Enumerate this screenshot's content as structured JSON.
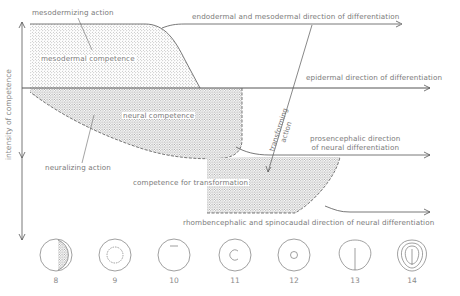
{
  "diagram": {
    "y_axis_label": "intensity of competence",
    "regions": {
      "mesodermal": "mesodermal competence",
      "neural": "neural competence",
      "transformation": "competence for transformation"
    },
    "actions": {
      "mesodermizing": "mesodermizing action",
      "neuralizing": "neuralizing action",
      "transforming_line1": "transforming",
      "transforming_line2": "action"
    },
    "directions": {
      "endo_meso": "endodermal and mesodermal direction of differentiation",
      "epidermal": "epidermal direction of differentiation",
      "prosencephalic_line1": "prosencephalic direction",
      "prosencephalic_line2": "of neural differentiation",
      "rhomben": "rhombencephalic and spinocaudal direction of neural differentiation"
    },
    "stages": [
      "8",
      "9",
      "10",
      "11",
      "12",
      "13",
      "14"
    ],
    "colors": {
      "line": "#555555",
      "text": "#7a7a7a",
      "stipple": "#9a9a9a"
    }
  }
}
